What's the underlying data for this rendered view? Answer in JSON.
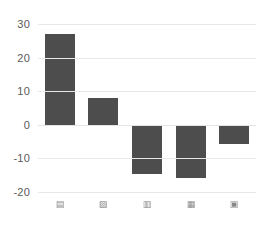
{
  "chart_data": {
    "type": "bar",
    "title": "",
    "subtitle": "",
    "xlabel": "",
    "ylabel": "",
    "categories": [
      "▤",
      "▨",
      "▥",
      "▦",
      "▣"
    ],
    "category_note": "x-axis tick labels are rendered as small illegible glyph marks",
    "values": [
      27,
      8,
      -14.7,
      -15.9,
      -5.8
    ],
    "ylim": [
      -20,
      30
    ],
    "yticks": [
      30,
      20,
      10,
      0,
      -10,
      -20
    ],
    "ytick_labels": [
      "30",
      "20",
      "10",
      "0",
      "-10",
      "-20"
    ],
    "grid": true,
    "grid_axis": "y",
    "legend": false,
    "legend_position": "none",
    "colors": {
      "bar": "#4d4d4d",
      "gridline": "#e8e8e8",
      "zero_line": "#e4e4e4",
      "tick_text": "#5a5a5a",
      "background": "#ffffff"
    },
    "bar_count": 5,
    "bar_width_px": 30
  }
}
